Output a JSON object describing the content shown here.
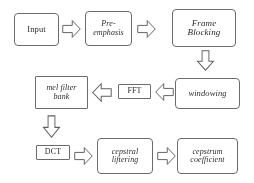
{
  "diagram": {
    "background_color": "#ffffff",
    "line_color": "#5f5f5f",
    "text_color": "#2a2a2a",
    "nodes": [
      {
        "id": "input",
        "label": "Input",
        "style": "upright"
      },
      {
        "id": "preemph",
        "line1": "Pre-",
        "line2": "emphasis",
        "style": "italic"
      },
      {
        "id": "frameblock",
        "line1": "Frame",
        "line2": "Blocking",
        "style": "italic"
      },
      {
        "id": "window",
        "label": "windowing",
        "style": "italic"
      },
      {
        "id": "fft",
        "label": "FFT",
        "style": "upright"
      },
      {
        "id": "melfilter",
        "line1": "mel filter",
        "line2": "bank",
        "style": "italic"
      },
      {
        "id": "dct",
        "label": "DCT",
        "style": "upright"
      },
      {
        "id": "cepliftr",
        "line1": "cepstral",
        "line2": "liftering",
        "style": "italic"
      },
      {
        "id": "cepcoef",
        "line1": "cepstrum",
        "line2": "coefficient",
        "style": "italic"
      }
    ],
    "arrows": [
      {
        "id": "input-to-preemph",
        "direction": "right"
      },
      {
        "id": "preemph-to-frameblock",
        "direction": "right"
      },
      {
        "id": "frameblock-to-window",
        "direction": "down"
      },
      {
        "id": "window-to-fft",
        "direction": "left"
      },
      {
        "id": "fft-to-melfilter",
        "direction": "left"
      },
      {
        "id": "melfilter-to-dct",
        "direction": "down"
      },
      {
        "id": "dct-to-cepliftr",
        "direction": "right"
      },
      {
        "id": "cepliftr-to-cepcoef",
        "direction": "right"
      }
    ]
  }
}
